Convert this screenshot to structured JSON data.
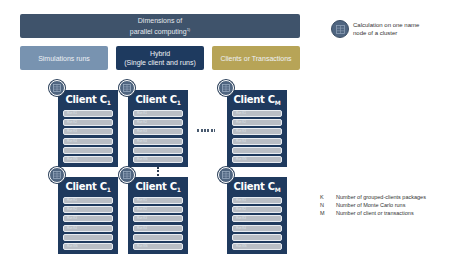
{
  "header": {
    "title_line1": "Dimensions of",
    "title_line2": "parallel computing",
    "footnote_mark": "1)"
  },
  "dimensions": [
    {
      "label_line1": "Simulations runs",
      "label_line2": "",
      "color": "#7893b0"
    },
    {
      "label_line1": "Hybrid",
      "label_line2": "(Single client and runs)",
      "color": "#1e3a5f"
    },
    {
      "label_line1": "Clients or Transactions",
      "label_line2": "",
      "color": "#b7a457"
    }
  ],
  "legend": {
    "icon": "server-node-icon",
    "text_line1": "Calculation on one name",
    "text_line2": "node of a cluster"
  },
  "cards": [
    {
      "title": "Client C",
      "sub": "1",
      "rows": [
        "Run K1",
        "Run K2",
        "Run K3",
        "Run K4",
        "",
        "Run KN"
      ]
    },
    {
      "title": "Client C",
      "sub": "1",
      "rows": [
        "Run K1",
        "Run K2",
        "Run K3",
        "Run K4",
        "",
        "Run KN"
      ]
    },
    {
      "title": "Client C",
      "sub": "M",
      "rows": [
        "Run K1",
        "Run K2",
        "Run K3",
        "Run K4",
        "",
        "Run KN"
      ]
    },
    {
      "title": "Client C",
      "sub": "1",
      "rows": [
        "Run K1",
        "Run K2",
        "Run K3",
        "Run K4",
        "",
        "Run KN"
      ]
    },
    {
      "title": "Client C",
      "sub": "1",
      "rows": [
        "Run K1",
        "Run K2",
        "Run K3",
        "Run K4",
        "",
        "Run KN"
      ]
    },
    {
      "title": "Client C",
      "sub": "M",
      "rows": [
        "Run K1",
        "Run K2",
        "Run K3",
        "Run K4",
        "",
        "Run KN"
      ]
    }
  ],
  "key": [
    {
      "symbol": "K",
      "text": "Number of grouped-clients packages"
    },
    {
      "symbol": "N",
      "text": "Number of Monte Carlo runs"
    },
    {
      "symbol": "M",
      "text": "Number of client or transactions"
    }
  ],
  "colors": {
    "header": "#3f536b",
    "card": "#1f3a5e",
    "row": "#b9bec5",
    "node": "#4f6580"
  }
}
